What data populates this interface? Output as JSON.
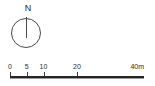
{
  "figure": {
    "kind": "map-legend",
    "background_color": "#ffffff",
    "ink_color": "#2b2b2b"
  },
  "north_arrow": {
    "name": "north-arrow",
    "label": "N",
    "needle_direction": "up",
    "shape": "circle",
    "stroke_color": "#4a4a4a"
  },
  "scale_bar": {
    "name": "scale-bar",
    "unit": "m",
    "min": 0,
    "max": 40,
    "bar_color": "#262626",
    "ticks": [
      {
        "value": 0,
        "label": "0",
        "position_pct": 0.0,
        "align": "center"
      },
      {
        "value": 5,
        "label": "5",
        "position_pct": 12.5,
        "align": "center"
      },
      {
        "value": 10,
        "label": "10",
        "position_pct": 25.0,
        "align": "center"
      },
      {
        "value": 20,
        "label": "20",
        "position_pct": 50.0,
        "align": "center"
      },
      {
        "value": 40,
        "label": "40m",
        "position_pct": 100.0,
        "align": "end"
      }
    ]
  }
}
